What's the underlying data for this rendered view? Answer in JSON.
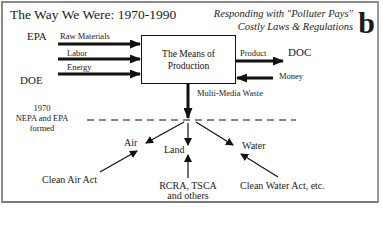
{
  "header": {
    "title": "The Way We Were: 1970-1990",
    "subtitle_line1": "Responding with \"Polluter Pays\"",
    "subtitle_line2": "Costly Laws & Regulations",
    "panel_letter": "b"
  },
  "agencies": {
    "top_left": "EPA",
    "bottom_left": "DOE",
    "output": "DOC"
  },
  "inputs": [
    {
      "label": "Raw Materials"
    },
    {
      "label": "Labor"
    },
    {
      "label": "Energy"
    }
  ],
  "process_box": {
    "line1": "The Means of",
    "line2": "Production"
  },
  "outputs": {
    "product": "Product",
    "money": "Money",
    "waste": "Multi-Media Waste"
  },
  "timeline_note": {
    "line1": "1970",
    "line2": "NEPA and EPA",
    "line3": "formed"
  },
  "media": {
    "air": "Air",
    "land": "Land",
    "water": "Water"
  },
  "laws": {
    "air": "Clean Air Act",
    "land_line1": "RCRA, TSCA",
    "land_line2": "and others",
    "water": "Clean Water Act, etc."
  },
  "colors": {
    "ink": "#111111",
    "frame": "#8a8a8a",
    "background": "#ffffff"
  }
}
